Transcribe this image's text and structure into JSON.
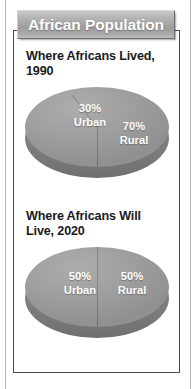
{
  "banner": {
    "title": "African Population"
  },
  "panels": [
    {
      "title": "Where Africans Lived, 1990",
      "slices": [
        {
          "percent": "30%",
          "name": "Urban"
        },
        {
          "percent": "70%",
          "name": "Rural"
        }
      ]
    },
    {
      "title": "Where Africans Will Live, 2020",
      "slices": [
        {
          "percent": "50%",
          "name": "Urban"
        },
        {
          "percent": "50%",
          "name": "Rural"
        }
      ]
    }
  ],
  "colors": {
    "banner_gray": "#a8a8a8",
    "pie_top": "#9b9b9b",
    "pie_side": "#7f7f7f",
    "box_border": "#4a4a4a",
    "label_text": "#ffffff",
    "title_text": "#1b1b1b"
  },
  "chart_data": [
    {
      "type": "pie",
      "title": "Where Africans Lived, 1990",
      "categories": [
        "Urban",
        "Rural"
      ],
      "values": [
        30,
        70
      ],
      "value_labels": [
        "30%",
        "70%"
      ],
      "units": "percent",
      "legend": "none",
      "three_d": true
    },
    {
      "type": "pie",
      "title": "Where Africans Will Live, 2020",
      "categories": [
        "Urban",
        "Rural"
      ],
      "values": [
        50,
        50
      ],
      "value_labels": [
        "50%",
        "50%"
      ],
      "units": "percent",
      "legend": "none",
      "three_d": true
    }
  ]
}
